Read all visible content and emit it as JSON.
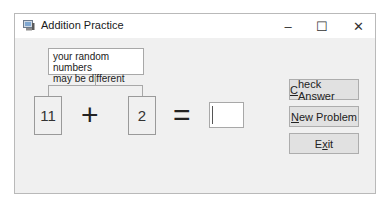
{
  "window": {
    "title": "Addition Practice",
    "controls": {
      "minimize": "–",
      "maximize": "☐",
      "close": "✕"
    }
  },
  "callout": {
    "line1": "your random numbers",
    "line2": "may be different"
  },
  "equation": {
    "first_number": "11",
    "operator": "+",
    "second_number": "2",
    "equals": "=",
    "answer_value": ""
  },
  "buttons": {
    "check": {
      "mnemonic": "C",
      "rest": "heck Answer"
    },
    "new": {
      "mnemonic": "N",
      "rest": "ew Problem"
    },
    "exit": {
      "pre": "E",
      "mnemonic": "x",
      "rest": "it"
    }
  }
}
